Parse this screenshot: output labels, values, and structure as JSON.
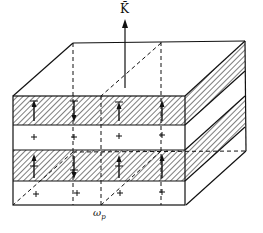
{
  "diagram": {
    "labels": {
      "wave_vector": "K̄",
      "frequency_symbol": "ω",
      "frequency_subscript": "p"
    },
    "colors": {
      "stroke": "#111111",
      "background": "#ffffff"
    },
    "front_face": {
      "left": 13,
      "right": 185,
      "top": 96,
      "bottom": 205,
      "layers": [
        {
          "type": "hatched",
          "top": 96,
          "bottom": 125
        },
        {
          "type": "clear",
          "top": 125,
          "bottom": 150
        },
        {
          "type": "hatched",
          "top": 150,
          "bottom": 181
        },
        {
          "type": "clear",
          "top": 181,
          "bottom": 205
        }
      ]
    },
    "depth_offset": {
      "dx": 60,
      "dy": -54
    },
    "charge_symbol": "+",
    "columns_x": [
      34,
      74,
      119,
      162
    ]
  }
}
